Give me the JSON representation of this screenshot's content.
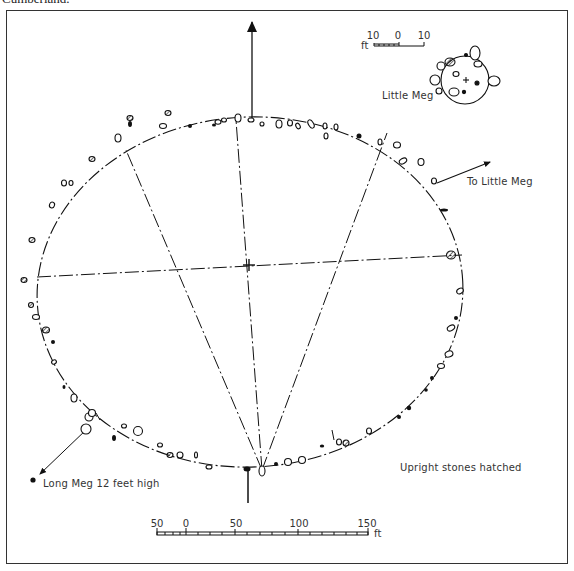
{
  "caption": "Cumberland.",
  "labels": {
    "little_meg": "Little Meg",
    "to_little_meg": "To Little Meg",
    "long_meg": "Long Meg 12 feet high",
    "legend_note": "Upright stones hatched"
  },
  "small_scale": {
    "ticks": [
      "10",
      "0",
      "10"
    ],
    "unit": "ft"
  },
  "main_scale": {
    "ticks": [
      "50",
      "0",
      "50",
      "100",
      "150"
    ],
    "unit": "ft"
  },
  "colors": {
    "ink": "#111111",
    "frame": "#333333",
    "paper": "#ffffff"
  }
}
